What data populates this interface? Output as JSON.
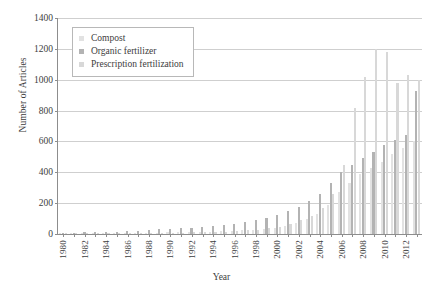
{
  "chart_data": {
    "type": "bar",
    "title": "",
    "xlabel": "Year",
    "ylabel": "Number of Articles",
    "ylim": [
      0,
      1400
    ],
    "ytick_step": 200,
    "yticks": [
      0,
      200,
      400,
      600,
      800,
      1000,
      1200,
      1400
    ],
    "grid": true,
    "legend_position": "upper-left",
    "xtick_labels": [
      "1980",
      "1982",
      "1984",
      "1986",
      "1988",
      "1990",
      "1992",
      "1994",
      "1996",
      "1998",
      "2000",
      "2002",
      "2004",
      "2006",
      "2008",
      "2010",
      "2012"
    ],
    "xtick_step": 2,
    "categories": [
      "1980",
      "1981",
      "1982",
      "1983",
      "1984",
      "1985",
      "1986",
      "1987",
      "1988",
      "1989",
      "1990",
      "1991",
      "1992",
      "1993",
      "1994",
      "1995",
      "1996",
      "1997",
      "1998",
      "1999",
      "2000",
      "2001",
      "2002",
      "2003",
      "2004",
      "2005",
      "2006",
      "2007",
      "2008",
      "2009",
      "2010",
      "2011",
      "2012",
      "2013"
    ],
    "series": [
      {
        "name": "Compost",
        "color": "#e2e2e2",
        "values": [
          2,
          2,
          3,
          3,
          4,
          4,
          6,
          7,
          8,
          9,
          10,
          11,
          13,
          14,
          16,
          18,
          20,
          24,
          28,
          34,
          42,
          55,
          70,
          95,
          130,
          190,
          270,
          330,
          390,
          430,
          470,
          520,
          560,
          600
        ]
      },
      {
        "name": "Organic fertilizer",
        "color": "#b3b3b3",
        "values": [
          8,
          9,
          10,
          11,
          13,
          14,
          18,
          22,
          26,
          30,
          34,
          38,
          42,
          46,
          52,
          58,
          66,
          76,
          88,
          105,
          125,
          150,
          175,
          215,
          260,
          330,
          400,
          450,
          490,
          530,
          580,
          610,
          640,
          930
        ]
      },
      {
        "name": "Prescription fertilization",
        "color": "#d8d8d8",
        "values": [
          1,
          1,
          2,
          2,
          3,
          3,
          4,
          5,
          6,
          7,
          8,
          9,
          10,
          12,
          14,
          16,
          19,
          23,
          28,
          36,
          48,
          66,
          88,
          120,
          170,
          260,
          450,
          820,
          1020,
          1200,
          1180,
          980,
          1030,
          1000
        ]
      }
    ]
  },
  "legend": {
    "items": [
      {
        "label": "Compost"
      },
      {
        "label": "Organic fertilizer"
      },
      {
        "label": "Prescription fertilization"
      }
    ]
  }
}
